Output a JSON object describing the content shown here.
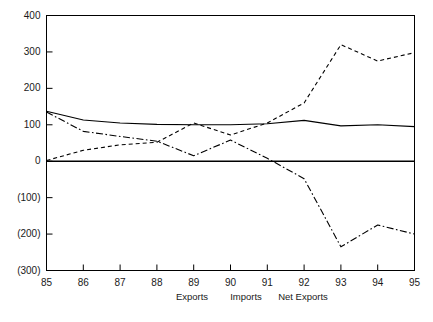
{
  "chart_data": {
    "type": "line",
    "title": "",
    "subtitle": "",
    "xlabel": "",
    "ylabel": "",
    "x": [
      "85",
      "86",
      "87",
      "88",
      "89",
      "90",
      "91",
      "92",
      "93",
      "94",
      "95"
    ],
    "categories": [
      "85",
      "86",
      "87",
      "88",
      "89",
      "90",
      "91",
      "92",
      "93",
      "94",
      "95"
    ],
    "xtick_labels": [
      "85",
      "86",
      "87",
      "88",
      "89",
      "90",
      "91",
      "92",
      "93",
      "94",
      "95"
    ],
    "ytick_labels": [
      "400",
      "300",
      "200",
      "100",
      "0",
      "(100)",
      "(200)",
      "(300)"
    ],
    "ytick_values": [
      400,
      300,
      200,
      100,
      0,
      -100,
      -200,
      -300
    ],
    "ylim": [
      -300,
      400
    ],
    "grid": false,
    "legend_position": "bottom",
    "series": [
      {
        "name": "Exports",
        "style": "solid",
        "color": "#000000",
        "values": [
          137,
          113,
          105,
          101,
          100,
          100,
          103,
          112,
          97,
          100,
          95
        ]
      },
      {
        "name": "Imports",
        "style": "dashed",
        "color": "#000000",
        "values": [
          2,
          30,
          45,
          52,
          105,
          72,
          105,
          160,
          320,
          275,
          298
        ]
      },
      {
        "name": "Net Exports",
        "style": "dashdot",
        "color": "#000000",
        "values": [
          135,
          82,
          68,
          55,
          15,
          58,
          8,
          -48,
          -235,
          -175,
          -200
        ]
      }
    ]
  },
  "legend": {
    "items": [
      {
        "label": "Exports"
      },
      {
        "label": "Imports"
      },
      {
        "label": "Net Exports"
      }
    ]
  },
  "axes": {
    "zero_line_value": "0",
    "frame_color": "#000000"
  }
}
